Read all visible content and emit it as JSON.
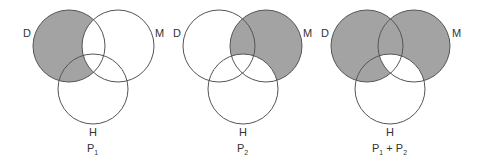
{
  "figure": {
    "shade_color": "#a3a3a3",
    "stroke_color": "#555555",
    "panels": [
      {
        "id": "P1",
        "caption_main": "P",
        "caption_sub": "1",
        "caption_text": "P1",
        "sets": {
          "D": "D",
          "M": "M",
          "H": "H"
        },
        "shaded_regions": [
          "D only",
          "D∩H not M"
        ],
        "description": "D minus M shaded"
      },
      {
        "id": "P2",
        "caption_main": "P",
        "caption_sub": "2",
        "caption_text": "P2",
        "sets": {
          "D": "D",
          "M": "M",
          "H": "H"
        },
        "shaded_regions": [
          "M only",
          "D∩M not H"
        ],
        "description": "M minus H shaded"
      },
      {
        "id": "P1+P2",
        "caption_main": "P",
        "caption_sub": "1",
        "caption_plus": " + P",
        "caption_sub2": "2",
        "caption_text": "P1 + P2",
        "sets": {
          "D": "D",
          "M": "M",
          "H": "H"
        },
        "shaded_regions": [
          "D only",
          "M only",
          "D∩M not H",
          "D∩H not M"
        ],
        "description": "Union of P1 and P2 shading"
      }
    ]
  }
}
